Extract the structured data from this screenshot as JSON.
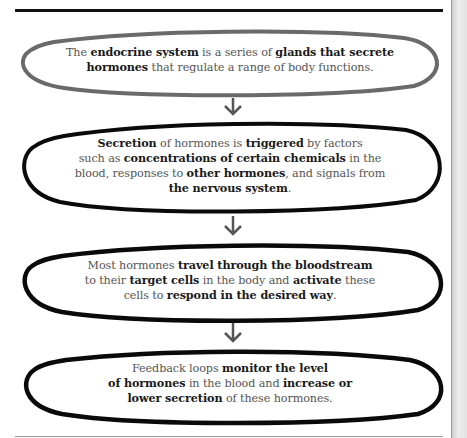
{
  "diagram": {
    "title": "",
    "colors": {
      "first_outline": "#6a6a6a",
      "outline": "#0a0a0a",
      "text": "#555555",
      "bold_text": "#1a1a1a",
      "arrow": "#555555"
    },
    "steps": [
      {
        "segments": [
          {
            "t": "The ",
            "b": false
          },
          {
            "t": "endocrine system",
            "b": true
          },
          {
            "t": " is a series of ",
            "b": false
          },
          {
            "t": "glands that secrete",
            "b": true
          },
          {
            "br": true
          },
          {
            "t": "hormones",
            "b": true
          },
          {
            "t": " that regulate a range of body functions.",
            "b": false
          }
        ]
      },
      {
        "segments": [
          {
            "t": "Secretion",
            "b": true
          },
          {
            "t": " of hormones is ",
            "b": false
          },
          {
            "t": "triggered",
            "b": true
          },
          {
            "t": " by factors",
            "b": false
          },
          {
            "br": true
          },
          {
            "t": "such as ",
            "b": false
          },
          {
            "t": "concentrations of certain chemicals",
            "b": true
          },
          {
            "t": " in the",
            "b": false
          },
          {
            "br": true
          },
          {
            "t": "blood, responses to ",
            "b": false
          },
          {
            "t": "other hormones",
            "b": true
          },
          {
            "t": ", and signals from",
            "b": false
          },
          {
            "br": true
          },
          {
            "t": "the nervous system",
            "b": true
          },
          {
            "t": ".",
            "b": false
          }
        ]
      },
      {
        "segments": [
          {
            "t": "Most hormones ",
            "b": false
          },
          {
            "t": "travel through the bloodstream",
            "b": true
          },
          {
            "br": true
          },
          {
            "t": "to their ",
            "b": false
          },
          {
            "t": "target cells",
            "b": true
          },
          {
            "t": " in the body and ",
            "b": false
          },
          {
            "t": "activate",
            "b": true
          },
          {
            "t": " these",
            "b": false
          },
          {
            "br": true
          },
          {
            "t": "cells to ",
            "b": false
          },
          {
            "t": "respond in the desired way",
            "b": true
          },
          {
            "t": ".",
            "b": false
          }
        ]
      },
      {
        "segments": [
          {
            "t": "Feedback loops ",
            "b": false
          },
          {
            "t": "monitor the level",
            "b": true
          },
          {
            "br": true
          },
          {
            "t": "of hormones",
            "b": true
          },
          {
            "t": " in the blood and ",
            "b": false
          },
          {
            "t": "increase or",
            "b": true
          },
          {
            "br": true
          },
          {
            "t": "lower secretion",
            "b": true
          },
          {
            "t": " of these hormones.",
            "b": false
          }
        ]
      }
    ],
    "arrows": [
      "down-arrow",
      "down-arrow",
      "down-arrow"
    ]
  }
}
